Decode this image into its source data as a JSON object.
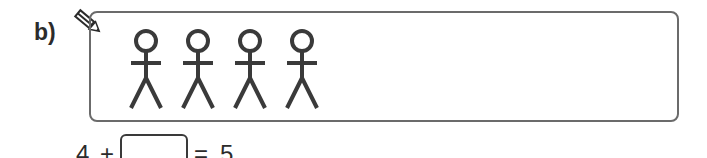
{
  "question": {
    "label": "b)",
    "icon": "pencil-icon",
    "figure_count": 4,
    "figures": [
      {
        "name": "stick-figure-1",
        "cx": 146
      },
      {
        "name": "stick-figure-2",
        "cx": 198
      },
      {
        "name": "stick-figure-3",
        "cx": 250
      },
      {
        "name": "stick-figure-4",
        "cx": 302
      }
    ],
    "equation": {
      "left_operand": "4",
      "operator": "+",
      "answer_value": "",
      "equals": "=",
      "result": "5"
    }
  },
  "colors": {
    "stroke": "#3a3a3a",
    "box_border": "#6b6b6b",
    "text": "#2b2b2b"
  }
}
